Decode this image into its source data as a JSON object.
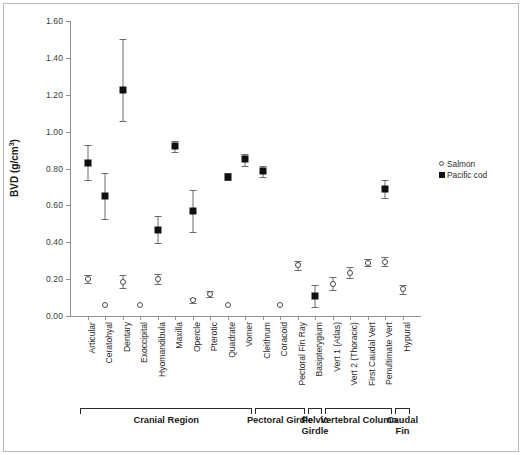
{
  "chart_data": {
    "type": "scatter",
    "title": "",
    "xlabel": "",
    "ylabel": "BVD (g/cm³)",
    "ylim": [
      0.0,
      1.6
    ],
    "yticks": [
      "0.00",
      "0.20",
      "0.40",
      "0.60",
      "0.80",
      "1.00",
      "1.20",
      "1.40",
      "1.60"
    ],
    "grid": false,
    "legend_position": "right",
    "categories": [
      "Articular",
      "Ceratohyal",
      "Dentary",
      "Exoccipital",
      "Hyomandibula",
      "Maxilla",
      "Opercle",
      "Pterotic",
      "Quadrate",
      "Vomer",
      "Cleithrum",
      "Coracoid",
      "Pectoral Fin Ray",
      "Basipterygium",
      "Vert 1 (Atlas)",
      "Vert 2 (Thoracic)",
      "First Caudal Vert",
      "Penultimate Vert",
      "Hypural"
    ],
    "series": [
      {
        "name": "Salmon",
        "marker": "open-circle",
        "values": [
          0.2,
          0.06,
          0.185,
          0.06,
          0.2,
          null,
          0.085,
          0.12,
          0.06,
          null,
          null,
          0.06,
          0.275,
          null,
          0.175,
          0.235,
          0.29,
          0.295,
          0.145
        ],
        "err_low": [
          0.18,
          0.06,
          0.15,
          0.06,
          0.175,
          null,
          0.07,
          0.105,
          0.06,
          null,
          null,
          0.06,
          0.25,
          null,
          0.14,
          0.205,
          0.27,
          0.27,
          0.12
        ],
        "err_high": [
          0.22,
          0.06,
          0.225,
          0.06,
          0.23,
          null,
          0.1,
          0.135,
          0.06,
          null,
          null,
          0.06,
          0.3,
          null,
          0.21,
          0.265,
          0.31,
          0.32,
          0.17
        ]
      },
      {
        "name": "Pacific cod",
        "marker": "filled-square",
        "values": [
          0.83,
          0.65,
          1.225,
          null,
          0.465,
          0.92,
          0.57,
          null,
          0.755,
          0.85,
          0.785,
          null,
          null,
          0.11,
          null,
          null,
          null,
          0.69,
          null
        ],
        "err_low": [
          0.735,
          0.525,
          1.06,
          null,
          0.395,
          0.89,
          0.455,
          null,
          0.735,
          0.815,
          0.755,
          null,
          null,
          0.05,
          null,
          null,
          null,
          0.64,
          null
        ],
        "err_high": [
          0.925,
          0.775,
          1.5,
          null,
          0.54,
          0.95,
          0.685,
          null,
          0.775,
          0.88,
          0.815,
          null,
          null,
          0.17,
          null,
          null,
          null,
          0.74,
          null
        ]
      }
    ],
    "regions": [
      {
        "label": "Cranial Region",
        "from": "Articular",
        "to": "Vomer"
      },
      {
        "label": "Pectoral Girdle",
        "from": "Cleithrum",
        "to": "Pectoral Fin Ray"
      },
      {
        "label": "Pelvic Girdle",
        "from": "Basipterygium",
        "to": "Basipterygium"
      },
      {
        "label": "Vertebral Column",
        "from": "Vert 1 (Atlas)",
        "to": "Penultimate Vert"
      },
      {
        "label": "Caudal Fin",
        "from": "Hypural",
        "to": "Hypural"
      }
    ],
    "colors": {
      "salmon_marker": "#4a4a4a",
      "cod_marker": "#111111",
      "axis": "#8f8f8f",
      "text": "#2b2b2b"
    }
  },
  "legend": {
    "items": [
      {
        "label": "Salmon"
      },
      {
        "label": "Pacific cod"
      }
    ]
  }
}
